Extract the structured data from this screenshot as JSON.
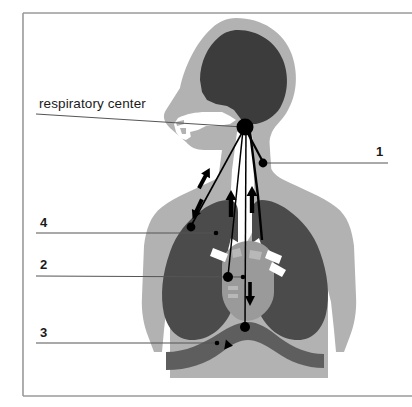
{
  "figure": {
    "title_text": "respiratory center",
    "frame": {
      "x": 22,
      "y": 13,
      "width": 390,
      "height": 382,
      "border_color": "#9a9a9a"
    },
    "background_color": "#ffffff",
    "colors": {
      "body": "#b2b2b2",
      "brain": "#3c3c3c",
      "lung": "#4b4b4b",
      "diaphragm": "#5e5e5e",
      "airway": "#ffffff",
      "marker": "#000000",
      "leader_line": "#555555",
      "text": "#1a1a1a"
    },
    "labels": [
      {
        "id": "respiratory-center",
        "text": "respiratory center",
        "kind": "text",
        "text_x": 39,
        "text_y": 96,
        "leader": {
          "x1": 36,
          "y1": 114,
          "x2": 240,
          "y2": 127
        },
        "target_x": 243,
        "target_y": 127
      },
      {
        "id": "num-1",
        "text": "1",
        "kind": "number",
        "text_x": 376,
        "text_y": 144,
        "leader": {
          "x1": 388,
          "y1": 163,
          "x2": 265,
          "y2": 163
        },
        "target_x": 263,
        "target_y": 163
      },
      {
        "id": "num-4",
        "text": "4",
        "kind": "number",
        "text_x": 40,
        "text_y": 215,
        "leader": {
          "x1": 36,
          "y1": 233,
          "x2": 215,
          "y2": 233
        },
        "target_x": 215,
        "target_y": 233
      },
      {
        "id": "num-2",
        "text": "2",
        "kind": "number",
        "text_x": 40,
        "text_y": 257,
        "leader": {
          "x1": 36,
          "y1": 275,
          "x2": 229,
          "y2": 277
        },
        "target_x": 229,
        "target_y": 277
      },
      {
        "id": "num-3",
        "text": "3",
        "kind": "number",
        "text_x": 40,
        "text_y": 325,
        "leader": {
          "x1": 36,
          "y1": 343,
          "x2": 218,
          "y2": 343
        },
        "target_x": 218,
        "target_y": 343
      }
    ],
    "markers": [
      {
        "id": "hub-respiratory-center",
        "x": 245,
        "y": 127,
        "r": 8
      },
      {
        "id": "marker-1-carotid-body",
        "x": 263,
        "y": 163,
        "r": 4.2
      },
      {
        "id": "marker-4-lung",
        "x": 191,
        "y": 227,
        "r": 4.2
      },
      {
        "id": "marker-4-lung-small",
        "x": 216,
        "y": 233,
        "r": 2.2
      },
      {
        "id": "marker-2-heart",
        "x": 228,
        "y": 277,
        "r": 5
      },
      {
        "id": "marker-2-heart-small",
        "x": 243,
        "y": 277,
        "r": 2.2
      },
      {
        "id": "marker-3-diaphragm",
        "x": 245,
        "y": 327,
        "r": 5
      },
      {
        "id": "marker-3-diaphragm-small",
        "x": 217,
        "y": 343,
        "r": 2.2
      }
    ]
  }
}
